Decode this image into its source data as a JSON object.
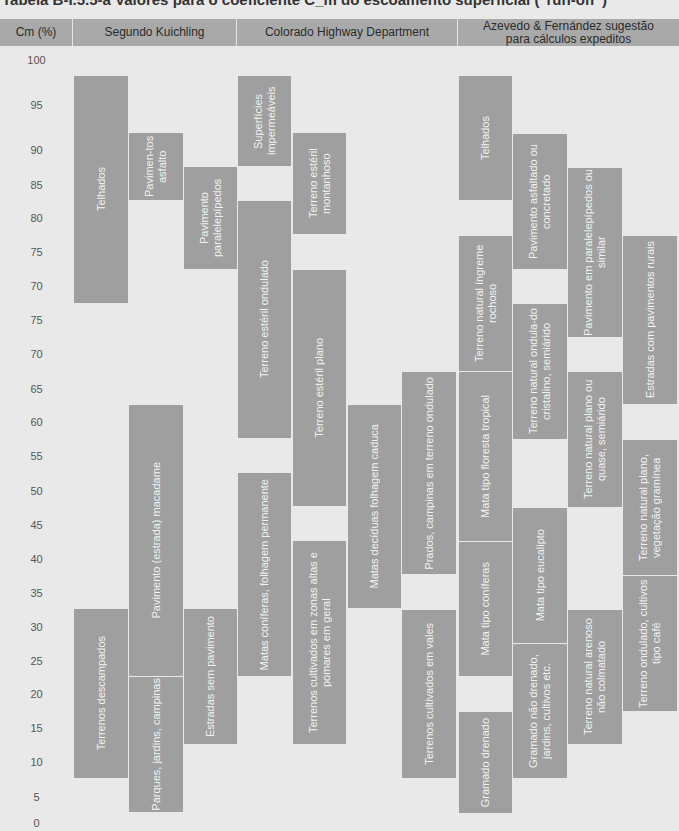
{
  "caption": "Tabela B-I.5.5-a Valores para o coeficiente C_m do escoamento superficial (\"run-off\")",
  "header": {
    "axis": "Cm (%)",
    "kuichling": "Segundo Kuichling",
    "colorado": "Colorado Highway Department",
    "azevedo": "Azevedo & Fernández sugestão para cálculos expeditos"
  },
  "colors": {
    "header_bg": "#a9a9a9",
    "body_bg": "#e9e9e9",
    "block_bg": "#9f9f9f",
    "block_text": "#f2f2f2"
  },
  "ticks": [
    {
      "label": "100",
      "y": 60
    },
    {
      "label": "95",
      "y": 105
    },
    {
      "label": "90",
      "y": 150
    },
    {
      "label": "85",
      "y": 185
    },
    {
      "label": "80",
      "y": 218
    },
    {
      "label": "75",
      "y": 252
    },
    {
      "label": "70",
      "y": 286
    },
    {
      "label": "75",
      "y": 320
    },
    {
      "label": "70",
      "y": 354
    },
    {
      "label": "65",
      "y": 389
    },
    {
      "label": "60",
      "y": 422
    },
    {
      "label": "55",
      "y": 456
    },
    {
      "label": "50",
      "y": 491
    },
    {
      "label": "45",
      "y": 525
    },
    {
      "label": "40",
      "y": 559
    },
    {
      "label": "35",
      "y": 593
    },
    {
      "label": "30",
      "y": 627
    },
    {
      "label": "25",
      "y": 661
    },
    {
      "label": "20",
      "y": 694
    },
    {
      "label": "15",
      "y": 728
    },
    {
      "label": "10",
      "y": 762
    },
    {
      "label": "5",
      "y": 797
    },
    {
      "label": "0",
      "y": 823
    }
  ],
  "chart_data": {
    "type": "table",
    "ylabel": "Cm (%)",
    "y_tick_labels": [
      "100",
      "95",
      "90",
      "85",
      "80",
      "75",
      "70",
      "75",
      "70",
      "65",
      "60",
      "55",
      "50",
      "45",
      "40",
      "35",
      "30",
      "25",
      "20",
      "15",
      "10",
      "5",
      "0"
    ],
    "groups": [
      {
        "name": "Segundo Kuichling",
        "ranges": [
          {
            "label": "Telhados",
            "min": 70,
            "max": 95
          },
          {
            "label": "Pavimentos asfalto",
            "min": 85,
            "max": 90
          },
          {
            "label": "Pavimento paralelepípedos",
            "min": 75,
            "max": 85
          },
          {
            "label": "Pavimento (estrada) macadame",
            "min": 25,
            "max": 60
          },
          {
            "label": "Terrenos descampados",
            "min": 10,
            "max": 30
          },
          {
            "label": "Parques, jardins, campinas",
            "min": 5,
            "max": 25
          },
          {
            "label": "Estradas sem pavimento",
            "min": 15,
            "max": 30
          }
        ]
      },
      {
        "name": "Colorado Highway Department",
        "ranges": [
          {
            "label": "Superfícies impermeáveis",
            "min": 90,
            "max": 95
          },
          {
            "label": "Terreno estéril montanhoso",
            "min": 80,
            "max": 90
          },
          {
            "label": "Terreno estéril ondulado",
            "min": 60,
            "max": 80
          },
          {
            "label": "Terreno estéril plano",
            "min": 50,
            "max": 75
          },
          {
            "label": "Matas decíduas folhagem caduca",
            "min": 35,
            "max": 60
          },
          {
            "label": "Prados, campinas em terreno ondulado",
            "min": 40,
            "max": 65
          },
          {
            "label": "Matas coníferas, folhagem permanente",
            "min": 25,
            "max": 50
          },
          {
            "label": "Terrenos cultivados em zonas altas e pomares em geral",
            "min": 15,
            "max": 40
          },
          {
            "label": "Terrenos cultivados em vales",
            "min": 10,
            "max": 30
          }
        ]
      },
      {
        "name": "Azevedo & Fernández sugestão para cálculos expeditos",
        "ranges": [
          {
            "label": "Telhados",
            "min": 85,
            "max": 95
          },
          {
            "label": "Pavimento asfaltado ou concretado",
            "min": 75,
            "max": 90
          },
          {
            "label": "Pavimento em paralelepípedos ou similar",
            "min": 70,
            "max": 85
          },
          {
            "label": "Estradas com pavimentos rurais",
            "min": 65,
            "max": 75
          },
          {
            "label": "Terreno natural íngreme rochoso",
            "min": 70,
            "max": 75
          },
          {
            "label": "Terreno natural ondulado do cristalino, semiárido",
            "min": 60,
            "max": 70
          },
          {
            "label": "Terreno natural plano ou quase, semiárido",
            "min": 50,
            "max": 65
          },
          {
            "label": "Mata tipo floresta tropical",
            "min": 45,
            "max": 65
          },
          {
            "label": "Terreno natural plano, vegetação gramínea",
            "min": 40,
            "max": 55
          },
          {
            "label": "Mata tipo eucalipto",
            "min": 30,
            "max": 45
          },
          {
            "label": "Mata tipo coníferas",
            "min": 25,
            "max": 45
          },
          {
            "label": "Terreno ondulado, cultivos tipo café",
            "min": 20,
            "max": 40
          },
          {
            "label": "Terreno natural arenoso não colmatado",
            "min": 15,
            "max": 30
          },
          {
            "label": "Gramado não drenado, jardins, cultivos etc.",
            "min": 10,
            "max": 25
          },
          {
            "label": "Gramado drenado",
            "min": 5,
            "max": 20
          }
        ]
      }
    ]
  },
  "blocks": [
    {
      "label": "Telhados",
      "x": 74,
      "y": 76,
      "w": 54,
      "h": 227
    },
    {
      "label": "Pavimen-tos asfalto",
      "x": 129,
      "y": 133,
      "w": 54,
      "h": 67
    },
    {
      "label": "Pavimento paralelepípedos",
      "x": 184,
      "y": 167,
      "w": 53,
      "h": 102
    },
    {
      "label": "Pavimento (estrada) macadame",
      "x": 129,
      "y": 405,
      "w": 54,
      "h": 271
    },
    {
      "label": "Parques, jardins, campinas",
      "x": 129,
      "y": 677,
      "w": 54,
      "h": 135
    },
    {
      "label": "Terrenos descampados",
      "x": 74,
      "y": 609,
      "w": 54,
      "h": 169
    },
    {
      "label": "Estradas sem pavimento",
      "x": 184,
      "y": 609,
      "w": 53,
      "h": 135
    },
    {
      "label": "Superfícies impermeáveis",
      "x": 238,
      "y": 76,
      "w": 53,
      "h": 90
    },
    {
      "label": "Terreno estéril montanhoso",
      "x": 293,
      "y": 133,
      "w": 53,
      "h": 101
    },
    {
      "label": "Terreno estéril ondulado",
      "x": 238,
      "y": 201,
      "w": 53,
      "h": 237
    },
    {
      "label": "Terreno estéril plano",
      "x": 293,
      "y": 270,
      "w": 53,
      "h": 236
    },
    {
      "label": "Matas decíduas folhagem caduca",
      "x": 348,
      "y": 405,
      "w": 53,
      "h": 203
    },
    {
      "label": "Prados, campinas em terreno ondulado",
      "x": 402,
      "y": 372,
      "w": 54,
      "h": 202
    },
    {
      "label": "Matas coníferas, folhagem permanente",
      "x": 238,
      "y": 473,
      "w": 53,
      "h": 203
    },
    {
      "label": "Terrenos cultivados em zonas altas e pomares em geral",
      "x": 293,
      "y": 541,
      "w": 53,
      "h": 203
    },
    {
      "label": "Terrenos cultivados em vales",
      "x": 402,
      "y": 610,
      "w": 54,
      "h": 168
    },
    {
      "label": "Telhados",
      "x": 459,
      "y": 76,
      "w": 53,
      "h": 124
    },
    {
      "label": "Pavimento asfaltado ou concretado",
      "x": 513,
      "y": 134,
      "w": 54,
      "h": 135
    },
    {
      "label": "Pavimento em paralelepípedos ou similar",
      "x": 568,
      "y": 168,
      "w": 54,
      "h": 169
    },
    {
      "label": "Estradas com pavimentos rurais",
      "x": 623,
      "y": 236,
      "w": 54,
      "h": 168
    },
    {
      "label": "Terreno natural íngreme rochoso",
      "x": 459,
      "y": 236,
      "w": 53,
      "h": 135
    },
    {
      "label": "Terreno natural ondula-do cristalino, semiárido",
      "x": 513,
      "y": 304,
      "w": 54,
      "h": 135
    },
    {
      "label": "Terreno natural plano ou quase, semiárido",
      "x": 568,
      "y": 372,
      "w": 54,
      "h": 135
    },
    {
      "label": "Mata tipo floresta tropical",
      "x": 459,
      "y": 372,
      "w": 53,
      "h": 169
    },
    {
      "label": "Terreno natural plano, vegetação gramínea",
      "x": 623,
      "y": 440,
      "w": 54,
      "h": 135
    },
    {
      "label": "Mata tipo eucalipto",
      "x": 513,
      "y": 508,
      "w": 54,
      "h": 135
    },
    {
      "label": "Mata tipo coníferas",
      "x": 459,
      "y": 542,
      "w": 53,
      "h": 134
    },
    {
      "label": "Terreno ondulado, cultivos tipo café",
      "x": 623,
      "y": 576,
      "w": 54,
      "h": 135
    },
    {
      "label": "Terreno natural arenoso não colmatado",
      "x": 568,
      "y": 610,
      "w": 54,
      "h": 134
    },
    {
      "label": "Gramado não drenado, jardins, cultivos etc.",
      "x": 513,
      "y": 644,
      "w": 54,
      "h": 134
    },
    {
      "label": "Gramado drenado",
      "x": 459,
      "y": 712,
      "w": 53,
      "h": 101
    }
  ]
}
